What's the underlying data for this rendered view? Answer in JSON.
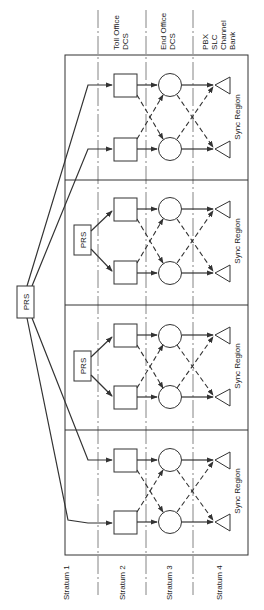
{
  "diagram": {
    "title_hidden": "",
    "strata_labels": [
      "Stratum 1",
      "Stratum 2",
      "Stratum 3",
      "Stratum 4"
    ],
    "column_headers": [
      {
        "lines": [
          "Toll Office",
          "DCS"
        ]
      },
      {
        "lines": [
          "End Office",
          "DCS"
        ]
      },
      {
        "lines": [
          "PBX",
          "SLC",
          "Channel",
          "Bank"
        ]
      }
    ],
    "main_source_label": "PRS",
    "regions": [
      {
        "label": "Sync Region",
        "has_local_prs": false,
        "local_prs_label": ""
      },
      {
        "label": "Sync Region",
        "has_local_prs": true,
        "local_prs_label": "PRS"
      },
      {
        "label": "Sync Region",
        "has_local_prs": true,
        "local_prs_label": "PRS"
      },
      {
        "label": "Sync Region",
        "has_local_prs": false,
        "local_prs_label": ""
      }
    ],
    "legend": {
      "square": "Toll Office DCS (Stratum 2)",
      "circle": "End Office DCS (Stratum 3)",
      "triangle": "PBX / SLC / Channel Bank (Stratum 4)",
      "solid_arrow": "primary timing reference",
      "dashed_arrow": "secondary timing reference"
    },
    "colors": {
      "line": "#333333",
      "background": "#ffffff",
      "separator": "#777777"
    }
  }
}
